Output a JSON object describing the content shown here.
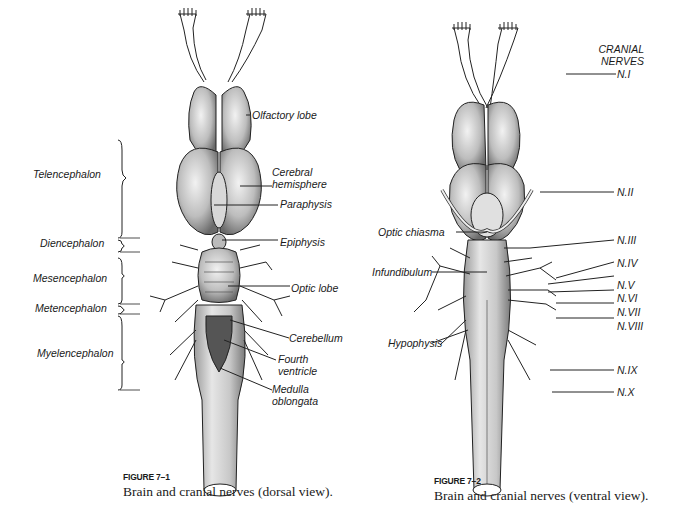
{
  "figure1": {
    "number": "FIGURE 7–1",
    "caption": "Brain and cranial nerves (dorsal view).",
    "region_labels": [
      "Telencephalon",
      "Diencephalon",
      "Mesencephalon",
      "Metencephalon",
      "Myelencephalon"
    ],
    "structure_labels": [
      "Olfactory lobe",
      "Cerebral",
      "hemisphere",
      "Paraphysis",
      "Epiphysis",
      "Optic lobe",
      "Cerebellum",
      "Fourth",
      "ventricle",
      "Medulla",
      "oblongata"
    ]
  },
  "figure2": {
    "number": "FIGURE 7–2",
    "caption": "Brain and cranial nerves (ventral view).",
    "heading": [
      "CRANIAL",
      "NERVES"
    ],
    "nerve_labels": [
      "N.I",
      "N.II",
      "N.III",
      "N.IV",
      "N.V",
      "N.VI",
      "N.VII",
      "N.VIII",
      "N.IX",
      "N.X"
    ],
    "structure_labels": [
      "Optic chiasma",
      "Infundibulum",
      "Hypophysis"
    ]
  }
}
